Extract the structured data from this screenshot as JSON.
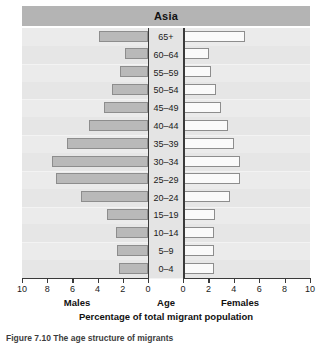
{
  "figure": {
    "caption": "Figure 7.10 The age structure of migrants"
  },
  "chart_data": {
    "type": "bar",
    "subtype": "population-pyramid",
    "title": "Asia",
    "xlabel": "Percentage of total migrant population",
    "ylabel": "Age",
    "categories": [
      "65+",
      "60–64",
      "55–59",
      "50–54",
      "45–49",
      "40–44",
      "35–39",
      "30–34",
      "25–29",
      "20–24",
      "15–19",
      "10–14",
      "5–9",
      "0–4"
    ],
    "series": [
      {
        "name": "Males",
        "side": "left",
        "values": [
          3.9,
          1.8,
          2.2,
          2.8,
          3.5,
          4.7,
          6.4,
          7.6,
          7.3,
          5.3,
          3.2,
          2.5,
          2.4,
          2.3
        ]
      },
      {
        "name": "Females",
        "side": "right",
        "values": [
          4.9,
          2.0,
          2.2,
          2.6,
          3.0,
          3.5,
          4.0,
          4.5,
          4.5,
          3.7,
          2.5,
          2.4,
          2.4,
          2.4
        ]
      }
    ],
    "xlim": [
      0,
      10
    ],
    "xticks": [
      0,
      2,
      4,
      6,
      8,
      10
    ],
    "xticks_left_order": [
      10,
      8,
      6,
      4,
      2,
      0
    ],
    "grid": false,
    "legend": "none",
    "left_axis_label": "Males",
    "center_axis_label": "Age",
    "right_axis_label": "Females",
    "colors": {
      "male_fill": "#b9b9b9",
      "female_fill": "#fafafa",
      "bar_border": "#8d8d8d",
      "title_bar": "#b4b4b4",
      "plot_background": "#ebebeb",
      "axis": "#3a3a3a"
    }
  }
}
